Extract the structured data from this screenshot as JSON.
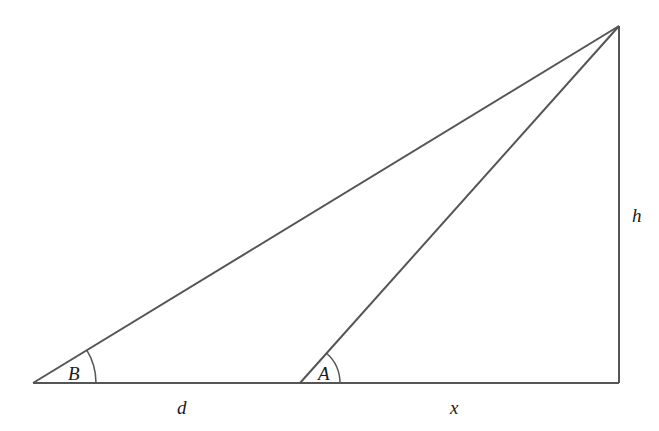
{
  "diagram": {
    "type": "right-triangle-angles-of-elevation",
    "labels": {
      "angle_b": "B",
      "angle_a": "A",
      "segment_d": "d",
      "segment_x": "x",
      "height_h": "h"
    },
    "colors": {
      "line": "#555555",
      "text": "#1a1a1a",
      "background": "#ffffff"
    }
  }
}
